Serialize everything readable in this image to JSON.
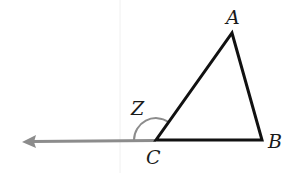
{
  "diagram": {
    "type": "triangle-exterior-angle",
    "vertices": [
      {
        "name": "A",
        "x": 232,
        "y": 33
      },
      {
        "name": "B",
        "x": 262,
        "y": 140
      },
      {
        "name": "C",
        "x": 156,
        "y": 140
      }
    ],
    "labels": {
      "A": "A",
      "B": "B",
      "C": "C",
      "angle": "Z"
    },
    "ray": {
      "from": "C",
      "direction": "left",
      "color": "#8c8c8c"
    },
    "colors": {
      "triangle": "#111111",
      "arc": "#8c8c8c",
      "ray": "#8c8c8c"
    }
  }
}
